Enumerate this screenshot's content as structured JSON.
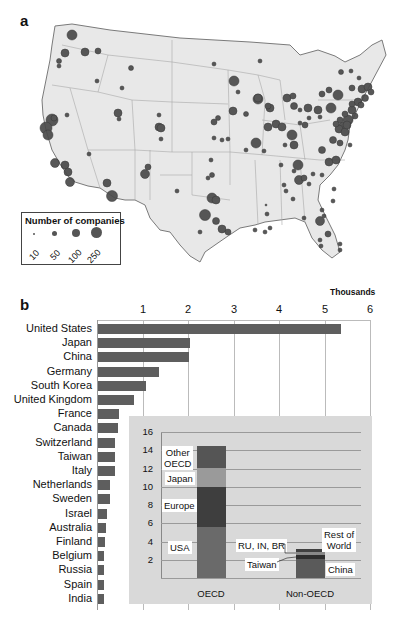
{
  "panel_a": {
    "label": "a",
    "legend": {
      "title": "Number of companies",
      "entries": [
        {
          "value": "10",
          "size": 2
        },
        {
          "value": "50",
          "size": 5
        },
        {
          "value": "100",
          "size": 8
        },
        {
          "value": "250",
          "size": 11
        }
      ]
    },
    "colors": {
      "land": "#e8e8e8",
      "border": "#8a8a8a",
      "bubble": "#4a4a4a"
    }
  },
  "panel_b": {
    "label": "b",
    "axis_unit": "Thousands",
    "ticks": [
      "1",
      "2",
      "3",
      "4",
      "5",
      "6"
    ],
    "inset": {
      "yticks": [
        "16",
        "14",
        "12",
        "10",
        "8",
        "6",
        "4",
        "2"
      ],
      "categories": [
        "OECD",
        "Non-OECD"
      ],
      "labels": {
        "other_oecd_1": "Other",
        "other_oecd_2": "OECD",
        "japan": "Japan",
        "europe": "Europe",
        "usa": "USA",
        "rest_1": "Rest of",
        "rest_2": "World",
        "ru_in_br": "RU, IN, BR",
        "taiwan": "Taiwan",
        "china": "China"
      }
    }
  },
  "chart_data": [
    {
      "type": "scatter",
      "title": "Number of companies (US map bubbles)",
      "legend": [
        "10",
        "50",
        "100",
        "250"
      ],
      "xlabel": "",
      "ylabel": ""
    },
    {
      "type": "bar",
      "orientation": "horizontal",
      "title": "",
      "xlabel": "Thousands",
      "ylabel": "",
      "xlim": [
        0,
        6
      ],
      "categories": [
        "United States",
        "Japan",
        "China",
        "Germany",
        "South Korea",
        "United Kingdom",
        "France",
        "Canada",
        "Switzerland",
        "Taiwan",
        "Italy",
        "Netherlands",
        "Sweden",
        "Israel",
        "Australia",
        "Finland",
        "Belgium",
        "Russia",
        "Spain",
        "India"
      ],
      "values": [
        5.35,
        2.02,
        2.0,
        1.34,
        1.06,
        0.8,
        0.47,
        0.45,
        0.38,
        0.38,
        0.38,
        0.27,
        0.27,
        0.2,
        0.18,
        0.16,
        0.13,
        0.13,
        0.13,
        0.13
      ],
      "grid": true
    },
    {
      "type": "bar",
      "stacked": true,
      "title": "",
      "xlabel": "",
      "ylabel": "",
      "ylim": [
        0,
        16
      ],
      "categories": [
        "OECD",
        "Non-OECD"
      ],
      "series": [
        {
          "name": "USA",
          "values": [
            5.35,
            0
          ],
          "color": "#6a6a6a"
        },
        {
          "name": "Europe",
          "values": [
            4.2,
            0
          ],
          "color": "#3e3e3e"
        },
        {
          "name": "Japan",
          "values": [
            2.0,
            0
          ],
          "color": "#9a9a9a"
        },
        {
          "name": "Other OECD",
          "values": [
            2.45,
            0
          ],
          "color": "#555555"
        },
        {
          "name": "China",
          "values": [
            0,
            2.0
          ],
          "color": "#5a5a5a"
        },
        {
          "name": "Taiwan",
          "values": [
            0,
            0.38
          ],
          "color": "#2e2e2e"
        },
        {
          "name": "RU, IN, BR",
          "values": [
            0,
            0.26
          ],
          "color": "#888888"
        },
        {
          "name": "Rest of World",
          "values": [
            0,
            0.3
          ],
          "color": "#404040"
        }
      ]
    }
  ]
}
